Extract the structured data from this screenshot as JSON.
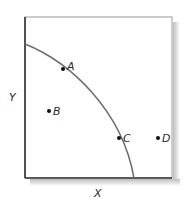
{
  "diagram": {
    "type": "production-possibilities-frontier",
    "axes": {
      "x_label": "X",
      "y_label": "Y"
    },
    "curve": {
      "name": "frontier",
      "color": "#6b6b6b",
      "start": [
        25,
        44
      ],
      "end": [
        134,
        178
      ]
    },
    "points": [
      {
        "label": "A",
        "x": 63,
        "y": 69,
        "position": "on curve"
      },
      {
        "label": "B",
        "x": 49,
        "y": 111,
        "position": "inside curve"
      },
      {
        "label": "C",
        "x": 119,
        "y": 138,
        "position": "on curve"
      },
      {
        "label": "D",
        "x": 158,
        "y": 138,
        "position": "outside curve"
      }
    ],
    "colors": {
      "frame": "#3a3a3a",
      "shadow": "#c8c8c8",
      "point": "#111111",
      "text": "#2a2a2a"
    }
  }
}
